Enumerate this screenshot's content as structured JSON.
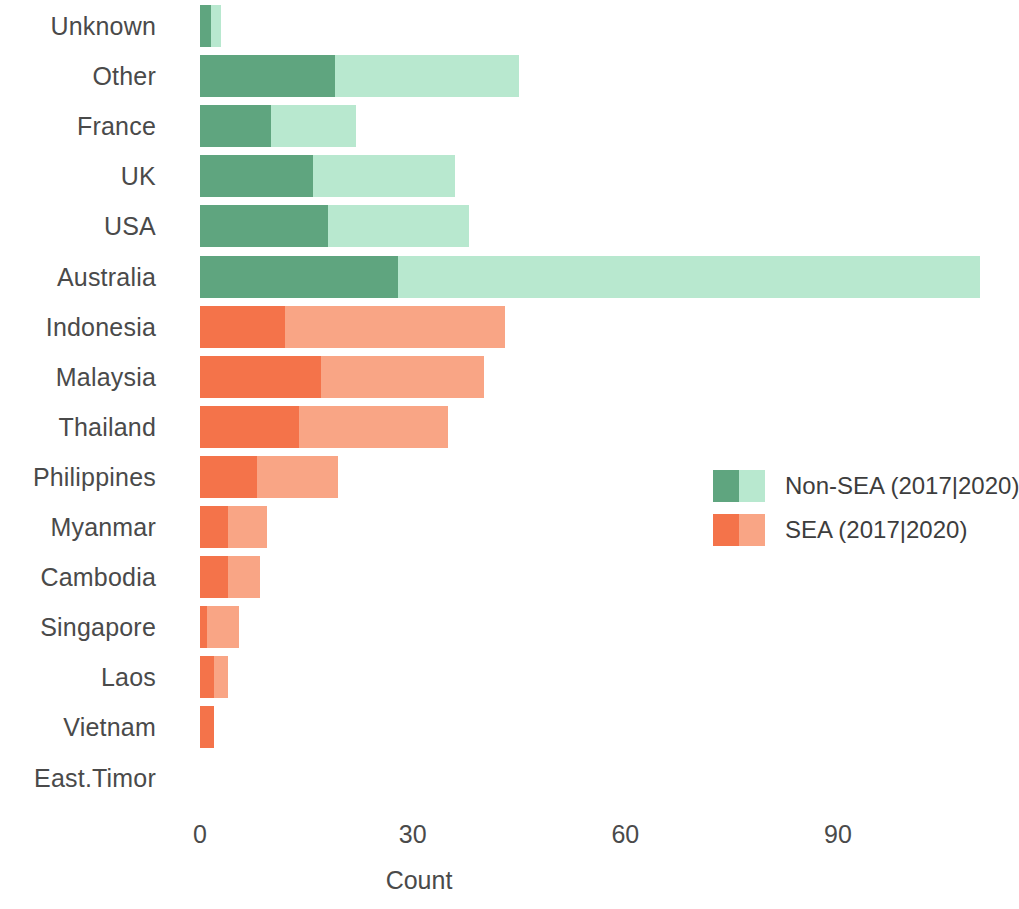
{
  "chart_data": {
    "type": "bar",
    "orientation": "horizontal",
    "stacked": true,
    "title": "",
    "subtitle": "",
    "xlabel": "Count",
    "ylabel": "",
    "xlim": [
      0,
      112
    ],
    "xticks": [
      0,
      30,
      60,
      90
    ],
    "xtick_labels": [
      "0",
      "30",
      "60",
      "90"
    ],
    "grid": false,
    "legend_position": "right-middle",
    "categories": [
      "Unknown",
      "Other",
      "France",
      "UK",
      "USA",
      "Australia",
      "Indonesia",
      "Malaysia",
      "Thailand",
      "Philippines",
      "Myanmar",
      "Cambodia",
      "Singapore",
      "Laos",
      "Vietnam",
      "East.Timor"
    ],
    "series": [
      {
        "name": "2017",
        "values": [
          1.5,
          19,
          10,
          16,
          18,
          28,
          12,
          17,
          14,
          8,
          4,
          4,
          1,
          2,
          2,
          0
        ]
      },
      {
        "name": "2020",
        "values": [
          1.5,
          26,
          12,
          20,
          20,
          82,
          31,
          23,
          21,
          11.5,
          5.5,
          4.5,
          4.5,
          2,
          0,
          0
        ]
      }
    ],
    "totals": [
      3,
      45,
      22,
      36,
      38,
      110,
      43,
      40,
      35,
      19.5,
      9.5,
      8.5,
      5.5,
      4,
      2,
      0
    ],
    "groups": [
      "Non-SEA",
      "Non-SEA",
      "Non-SEA",
      "Non-SEA",
      "Non-SEA",
      "Non-SEA",
      "SEA",
      "SEA",
      "SEA",
      "SEA",
      "SEA",
      "SEA",
      "SEA",
      "SEA",
      "SEA",
      "SEA"
    ],
    "annotations": []
  },
  "legend": {
    "entries": [
      {
        "label": "Non-SEA  (2017|2020)",
        "color_2017": "#5fa57f",
        "color_2020": "#b8e8cf"
      },
      {
        "label": "SEA  (2017|2020)",
        "color_2017": "#f4734a",
        "color_2020": "#f9a585"
      }
    ]
  },
  "colors": {
    "non_sea_2017": "#5fa57f",
    "non_sea_2020": "#b8e8cf",
    "sea_2017": "#f4734a",
    "sea_2020": "#f9a585",
    "text": "#4a4a4a",
    "background": "#ffffff"
  }
}
